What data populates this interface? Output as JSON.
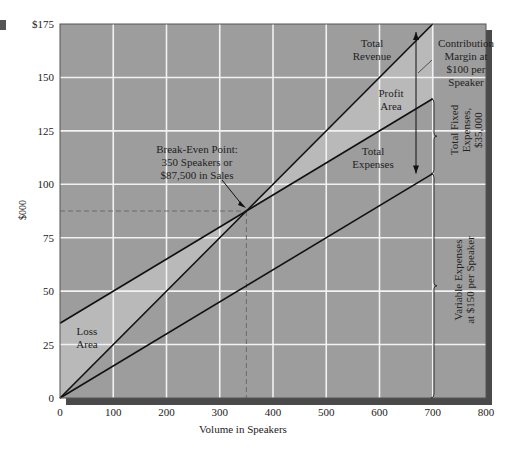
{
  "chart_data": {
    "type": "line",
    "title": "",
    "xlabel": "Volume in Speakers",
    "ylabel": "$000",
    "xlim": [
      0,
      800
    ],
    "ylim": [
      0,
      175
    ],
    "x_ticks": [
      "0",
      "100",
      "200",
      "300",
      "400",
      "500",
      "600",
      "700",
      "800"
    ],
    "y_ticks": [
      "0",
      "25",
      "50",
      "75",
      "100",
      "125",
      "150",
      "$175"
    ],
    "grid": true,
    "x": [
      0,
      700
    ],
    "series": [
      {
        "name": "Total Revenue",
        "values": [
          0,
          175
        ],
        "note": "$250 per speaker, clipped at top"
      },
      {
        "name": "Total Expenses",
        "values": [
          35,
          140
        ]
      },
      {
        "name": "Variable Expenses",
        "values": [
          0,
          105
        ]
      }
    ],
    "break_even": {
      "units": 350,
      "sales_thousands": 87.5
    },
    "annotations": {
      "total_revenue": [
        "Total",
        "Revenue"
      ],
      "contribution_margin": [
        "Contribution",
        "Margin at",
        "$100 per",
        "Speaker"
      ],
      "profit_area": [
        "Profit",
        "Area"
      ],
      "total_expenses": [
        "Total",
        "Expenses"
      ],
      "break_even": [
        "Break-Even Point:",
        "350 Speakers or",
        "$87,500 in Sales"
      ],
      "loss_area": [
        "Loss",
        "Area"
      ],
      "total_fixed": [
        "Total Fixed",
        "Expenses,",
        "$35,000"
      ],
      "variable": [
        "Variable Expenses",
        "at $150 per Speaker"
      ]
    }
  },
  "colors": {
    "plot_bg": "#9d9d9d",
    "shaded_area": "#b9b9b9",
    "grid": "#f2f2f2",
    "line": "#111111",
    "shadow": "#4a4a4a"
  }
}
